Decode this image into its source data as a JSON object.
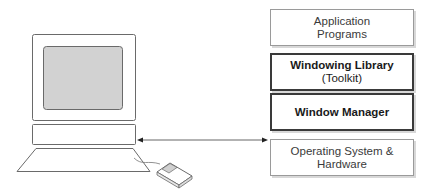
{
  "diagram": {
    "type": "layered-architecture",
    "layers": [
      {
        "line1": "Application",
        "line2": "Programs",
        "emphasis": "normal"
      },
      {
        "line1": "Windowing Library",
        "line2": "(Toolkit)",
        "emphasis": "bold-title"
      },
      {
        "line1": "Window Manager",
        "line2": "",
        "emphasis": "bold"
      },
      {
        "line1": "Operating System &",
        "line2": "Hardware",
        "emphasis": "normal"
      }
    ],
    "connector": {
      "from": "computer-system-unit",
      "to": "layer-operating-system",
      "style": "double-arrow"
    },
    "computer": {
      "parts": [
        "monitor",
        "screen",
        "system-unit",
        "keyboard",
        "mouse"
      ]
    }
  }
}
